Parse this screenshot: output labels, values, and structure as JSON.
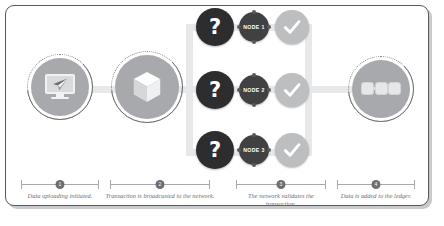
{
  "diagram": {
    "type": "process-flow",
    "colors": {
      "frame_border": "#58595b",
      "frame_shadow": "#c9cacb",
      "rail": "#e7e8e9",
      "icon_disc": "#a7a9ac",
      "question_circle": "#2d2d2f",
      "node_circle": "#414042",
      "check_circle": "#bcbec0",
      "text": "#6d6e71",
      "background": "#ffffff"
    }
  },
  "stages": [
    {
      "index": "1",
      "icon": "monitor-send-icon",
      "caption": "Data uploading initiated."
    },
    {
      "index": "2",
      "icon": "cube-block-icon",
      "caption": "Transaction is broadcasted to the network."
    },
    {
      "index": "3",
      "icon": "validation-grid",
      "caption": "The network validates the transaction."
    },
    {
      "index": "4",
      "icon": "chain-links-icon",
      "caption": "Data is added to the ledger."
    }
  ],
  "validation_rows": [
    {
      "question": "?",
      "node_label": "NODE 1",
      "check": "check-icon"
    },
    {
      "question": "?",
      "node_label": "NODE 2",
      "check": "check-icon"
    },
    {
      "question": "?",
      "node_label": "NODE 3",
      "check": "check-icon"
    }
  ]
}
